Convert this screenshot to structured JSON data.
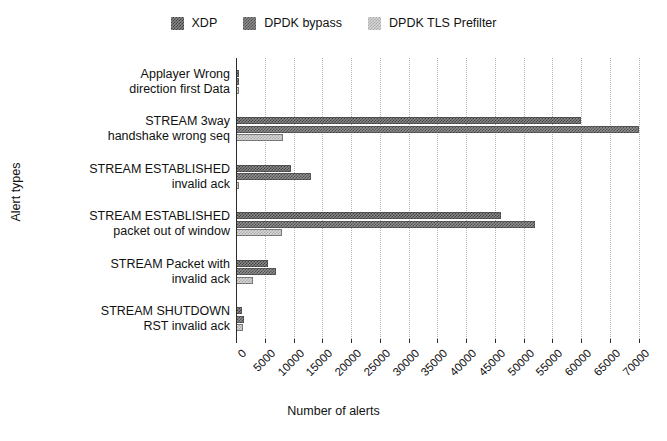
{
  "chart_data": {
    "type": "bar",
    "orientation": "horizontal",
    "title": "",
    "xlabel": "Number of alerts",
    "ylabel": "Alert types",
    "xlim": [
      0,
      72000
    ],
    "grid": true,
    "legend_position": "top-center",
    "xticks": [
      "0",
      "5000",
      "10000",
      "15000",
      "20000",
      "25000",
      "30000",
      "35000",
      "40000",
      "45000",
      "50000",
      "55000",
      "60000",
      "65000",
      "70000"
    ],
    "xtick_values": [
      0,
      5000,
      10000,
      15000,
      20000,
      25000,
      30000,
      35000,
      40000,
      45000,
      50000,
      55000,
      60000,
      65000,
      70000
    ],
    "categories": [
      "Applayer Wrong direction first Data",
      "STREAM 3way handshake wrong seq",
      "STREAM ESTABLISHED invalid ack",
      "STREAM ESTABLISHED packet out of window",
      "STREAM Packet with invalid ack",
      "STREAM SHUTDOWN RST invalid ack"
    ],
    "category_lines": [
      [
        "Applayer Wrong",
        "direction first Data"
      ],
      [
        "STREAM 3way",
        "handshake wrong seq"
      ],
      [
        "STREAM ESTABLISHED",
        "invalid ack"
      ],
      [
        "STREAM ESTABLISHED",
        "packet out of window"
      ],
      [
        "STREAM Packet with",
        "invalid ack"
      ],
      [
        "STREAM SHUTDOWN",
        "RST invalid ack"
      ]
    ],
    "series": [
      {
        "name": "XDP",
        "color": "#555555",
        "pattern": "checker-dark",
        "values": [
          400,
          60000,
          9500,
          46000,
          5500,
          1100
        ]
      },
      {
        "name": "DPDK bypass",
        "color": "#5c5c5c",
        "pattern": "checker-dark",
        "values": [
          500,
          70000,
          13000,
          52000,
          7000,
          1400
        ]
      },
      {
        "name": "DPDK TLS Prefilter",
        "color": "#c4c4c4",
        "pattern": "checker-light",
        "values": [
          350,
          8200,
          500,
          8000,
          3000,
          1200
        ]
      }
    ]
  },
  "legend": {
    "entries": [
      {
        "label": "XDP",
        "swatch": "legend-swatch-xdp"
      },
      {
        "label": "DPDK bypass",
        "swatch": "legend-swatch-dpdk-bypass"
      },
      {
        "label": "DPDK TLS Prefilter",
        "swatch": "legend-swatch-dpdk-tls-prefilter"
      }
    ]
  },
  "colors": {
    "xdp": "#555555",
    "dpdk_bypass": "#5c5c5c",
    "dpdk_tls_prefilter": "#c4c4c4",
    "axis": "#2b2b2b",
    "grid": "#b4b4b4",
    "background": "#ffffff"
  }
}
